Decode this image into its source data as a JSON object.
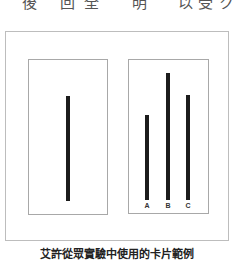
{
  "top_text": {
    "chars": [
      "後",
      "回",
      "全",
      "明",
      "以",
      "受",
      "ク"
    ]
  },
  "figure": {
    "reference_card": {
      "line": {
        "relative_length": 1.0
      }
    },
    "comparison_card": {
      "lines": [
        {
          "label": "A",
          "relative_length": 0.81
        },
        {
          "label": "B",
          "relative_length": 1.21
        },
        {
          "label": "C",
          "relative_length": 1.0
        }
      ]
    },
    "line_color": "#1c1c1c"
  },
  "caption": "艾許從眾實驗中使用的卡片範例"
}
